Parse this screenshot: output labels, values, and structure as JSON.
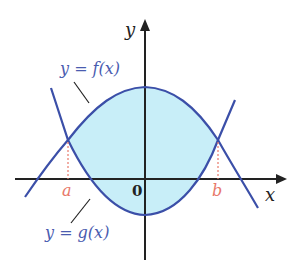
{
  "diagram": {
    "axes": {
      "x_label": "x",
      "y_label": "y",
      "origin_label": "0"
    },
    "curves": [
      {
        "name": "f",
        "label": "y = f(x)"
      },
      {
        "name": "g",
        "label": "y = g(x)"
      }
    ],
    "bounds": {
      "a_label": "a",
      "b_label": "b"
    },
    "colors": {
      "curve": "#3b4fa8",
      "fill": "#c8eef8",
      "axis": "#222222",
      "bound": "#e8786a",
      "label": "#4a5cb0"
    }
  }
}
